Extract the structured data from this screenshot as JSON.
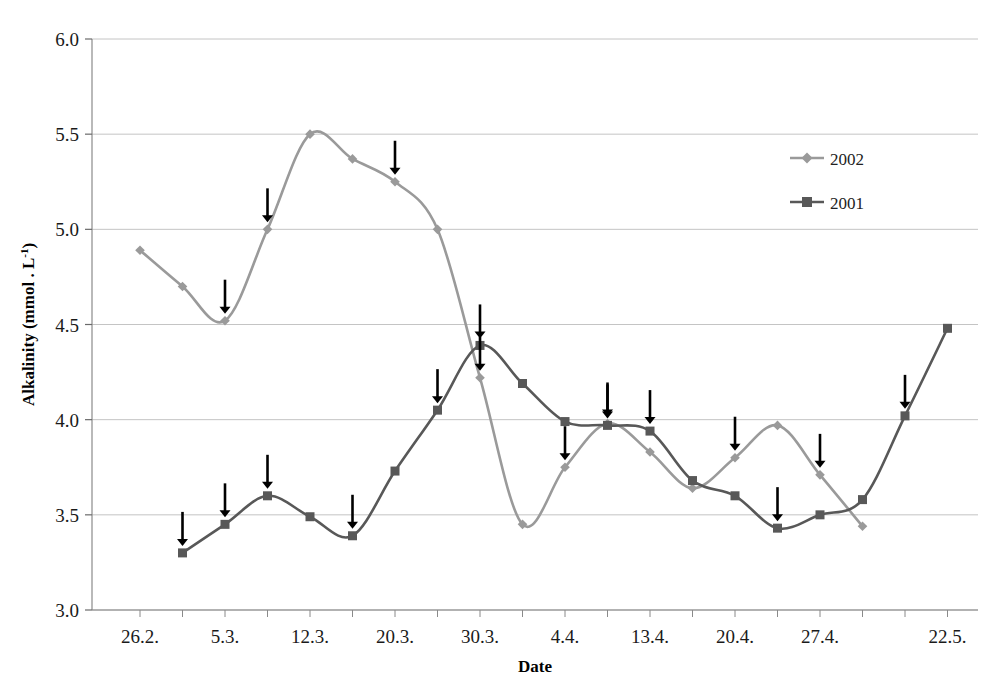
{
  "chart_data": {
    "type": "line",
    "title": "",
    "xlabel": "Date",
    "ylabel": "Alkalinity (mmol . L-1)",
    "ylabel_main": "Alkalinity (mmol . L",
    "ylabel_sup": "-1",
    "ylabel_tail": ")",
    "ylim": [
      3.0,
      6.0
    ],
    "ytick_labels": [
      "6.0",
      "5.5",
      "5.0",
      "4.5",
      "4.0",
      "3.5",
      "3.0"
    ],
    "ytick_values": [
      6.0,
      5.5,
      5.0,
      4.5,
      4.0,
      3.5,
      3.0
    ],
    "grid": true,
    "legend_position": "top-right",
    "xtick_labels": [
      "26.2.",
      "5.3.",
      "12.3.",
      "20.3.",
      "30.3.",
      "4.4.",
      "13.4.",
      "20.4.",
      "27.4.",
      "22.5."
    ],
    "xtick_indices": [
      0,
      2,
      4,
      6,
      8,
      10,
      12,
      14,
      16,
      19
    ],
    "n_categories": 20,
    "series": [
      {
        "name": "2002",
        "color": "#9a9a9a",
        "marker": "diamond",
        "start_index": 0,
        "values": [
          4.89,
          4.7,
          4.52,
          5.0,
          5.5,
          5.37,
          5.25,
          5.0,
          4.22,
          3.45,
          3.75,
          3.98,
          3.83,
          3.64,
          3.8,
          3.97,
          3.71,
          3.44
        ]
      },
      {
        "name": "2001",
        "color": "#585858",
        "marker": "square",
        "start_index": 1,
        "values": [
          3.3,
          3.45,
          3.6,
          3.49,
          3.39,
          3.73,
          4.05,
          4.39,
          4.19,
          3.99,
          3.97,
          3.94,
          3.68,
          3.6,
          3.43,
          3.5,
          3.58,
          4.02,
          4.48
        ]
      }
    ],
    "annotations": {
      "symbol": "down-arrow",
      "color": "#000000",
      "items": [
        {
          "series": "2002",
          "index": 2,
          "value": 4.52
        },
        {
          "series": "2002",
          "index": 3,
          "value": 5.0
        },
        {
          "series": "2002",
          "index": 6,
          "value": 5.25
        },
        {
          "series": "2002",
          "index": 8,
          "value": 4.22
        },
        {
          "series": "2002",
          "index": 10,
          "value": 3.75
        },
        {
          "series": "2002",
          "index": 11,
          "value": 3.98
        },
        {
          "series": "2002",
          "index": 14,
          "value": 3.8
        },
        {
          "series": "2002",
          "index": 16,
          "value": 3.71
        },
        {
          "series": "2001",
          "index": 1,
          "value": 3.3
        },
        {
          "series": "2001",
          "index": 2,
          "value": 3.45
        },
        {
          "series": "2001",
          "index": 3,
          "value": 3.6
        },
        {
          "series": "2001",
          "index": 5,
          "value": 3.49
        },
        {
          "series": "2001",
          "index": 7,
          "value": 3.73
        },
        {
          "series": "2001",
          "index": 8,
          "value": 4.05
        },
        {
          "series": "2001",
          "index": 11,
          "value": 3.99
        },
        {
          "series": "2001",
          "index": 12,
          "value": 3.97
        },
        {
          "series": "2001",
          "index": 15,
          "value": 3.6
        },
        {
          "series": "2001",
          "index": 18,
          "value": 4.02
        }
      ]
    }
  },
  "legend": {
    "entries": [
      {
        "label": "2002",
        "color": "#9a9a9a",
        "marker": "diamond"
      },
      {
        "label": "2001",
        "color": "#585858",
        "marker": "square"
      }
    ]
  }
}
